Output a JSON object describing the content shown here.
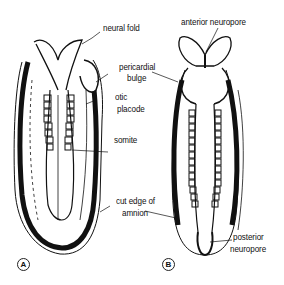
{
  "figure": {
    "panels": [
      {
        "id": "A",
        "label": "A"
      },
      {
        "id": "B",
        "label": "B"
      }
    ],
    "labels": {
      "neural_fold": "neural fold",
      "pericardial_bulge_1": "pericardial",
      "pericardial_bulge_2": "bulge",
      "otic_placode_1": "otic",
      "otic_placode_2": "placode",
      "somite": "somite",
      "cut_edge_1": "cut edge of",
      "cut_edge_2": "amnion",
      "anterior_neuropore": "anterior neuropore",
      "posterior_neuropore_1": "posterior",
      "posterior_neuropore_2": "neuropore"
    },
    "colors": {
      "ink": "#111111",
      "background": "#ffffff"
    }
  }
}
